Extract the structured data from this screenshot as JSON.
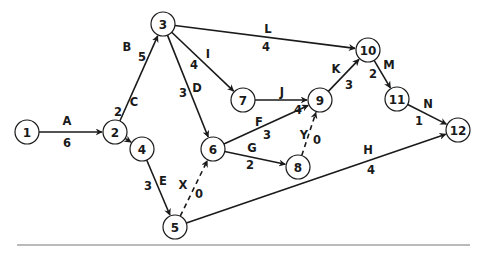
{
  "diagram": {
    "type": "activity-on-arrow network",
    "nodes": [
      {
        "id": "1",
        "label": "1"
      },
      {
        "id": "2",
        "label": "2"
      },
      {
        "id": "3",
        "label": "3"
      },
      {
        "id": "4",
        "label": "4"
      },
      {
        "id": "5",
        "label": "5"
      },
      {
        "id": "6",
        "label": "6"
      },
      {
        "id": "7",
        "label": "7"
      },
      {
        "id": "8",
        "label": "8"
      },
      {
        "id": "9",
        "label": "9"
      },
      {
        "id": "10",
        "label": "10"
      },
      {
        "id": "11",
        "label": "11"
      },
      {
        "id": "12",
        "label": "12"
      }
    ],
    "activities": [
      {
        "name": "A",
        "from": "1",
        "to": "2",
        "duration": "6",
        "dummy": false
      },
      {
        "name": "B",
        "from": "2",
        "to": "3",
        "duration": "5",
        "dummy": false
      },
      {
        "name": "C",
        "from": "2",
        "to": "4",
        "duration": "2",
        "dummy": false
      },
      {
        "name": "D",
        "from": "3",
        "to": "6",
        "duration": "3",
        "dummy": false
      },
      {
        "name": "E",
        "from": "4",
        "to": "5",
        "duration": "3",
        "dummy": false
      },
      {
        "name": "F",
        "from": "6",
        "to": "9",
        "duration": "3",
        "dummy": false
      },
      {
        "name": "G",
        "from": "6",
        "to": "8",
        "duration": "2",
        "dummy": false
      },
      {
        "name": "H",
        "from": "5",
        "to": "12",
        "duration": "4",
        "dummy": false
      },
      {
        "name": "I",
        "from": "3",
        "to": "7",
        "duration": "4",
        "dummy": false
      },
      {
        "name": "J",
        "from": "7",
        "to": "9",
        "duration": "4",
        "dummy": false
      },
      {
        "name": "K",
        "from": "9",
        "to": "10",
        "duration": "3",
        "dummy": false
      },
      {
        "name": "L",
        "from": "3",
        "to": "10",
        "duration": "4",
        "dummy": false
      },
      {
        "name": "M",
        "from": "10",
        "to": "11",
        "duration": "2",
        "dummy": false
      },
      {
        "name": "N",
        "from": "11",
        "to": "12",
        "duration": "1",
        "dummy": false
      },
      {
        "name": "X",
        "from": "5",
        "to": "6",
        "duration": "0",
        "dummy": true
      },
      {
        "name": "Y",
        "from": "8",
        "to": "9",
        "duration": "0",
        "dummy": true
      }
    ]
  }
}
